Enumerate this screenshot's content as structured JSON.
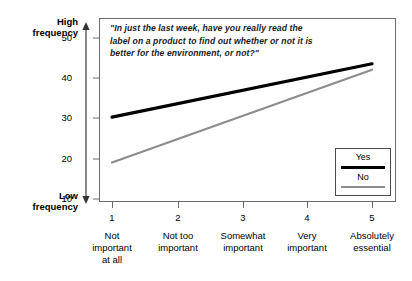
{
  "chart_data": {
    "type": "line",
    "title": "",
    "question": "\"In just the last week, have you really read the label on a product to find out whether or not it is better for the environment, or not?\"",
    "xlabel": "",
    "ylabel": "",
    "y_axis_annotation_top": "High\nfrequency",
    "y_axis_annotation_bottom": "Low\nfrequency",
    "grid": false,
    "legend_position": "bottom-right",
    "ylim": [
      7,
      54
    ],
    "yticks": [
      10,
      20,
      30,
      40,
      50
    ],
    "x": [
      1,
      2,
      3,
      4,
      5
    ],
    "categories": [
      "Not important at all",
      "Not too important",
      "Somewhat important",
      "Very important",
      "Absolutely essential"
    ],
    "series": [
      {
        "name": "Yes",
        "color": "#000000",
        "width": 3.2,
        "values": [
          28.5,
          31.9,
          35.3,
          38.7,
          42.0
        ]
      },
      {
        "name": "No",
        "color": "#8c8c8c",
        "width": 2.2,
        "values": [
          17.0,
          22.9,
          28.8,
          34.7,
          40.5
        ]
      }
    ]
  },
  "axis": {
    "high_frequency_line1": "High",
    "high_frequency_line2": "frequency",
    "low_frequency_line1": "Low",
    "low_frequency_line2": "frequency",
    "y_ticks": [
      {
        "value": "50"
      },
      {
        "value": "40"
      },
      {
        "value": "30"
      },
      {
        "value": "20"
      },
      {
        "value": "10"
      }
    ],
    "x_ticks": [
      {
        "number": "1",
        "caption_line1": "Not",
        "caption_line2": "important",
        "caption_line3": "at all"
      },
      {
        "number": "2",
        "caption_line1": "Not too",
        "caption_line2": "important",
        "caption_line3": ""
      },
      {
        "number": "3",
        "caption_line1": "Somewhat",
        "caption_line2": "important",
        "caption_line3": ""
      },
      {
        "number": "4",
        "caption_line1": "Very",
        "caption_line2": "important",
        "caption_line3": ""
      },
      {
        "number": "5",
        "caption_line1": "Absolutely",
        "caption_line2": "essential",
        "caption_line3": ""
      }
    ]
  },
  "legend": {
    "yes_label": "Yes",
    "no_label": "No"
  }
}
